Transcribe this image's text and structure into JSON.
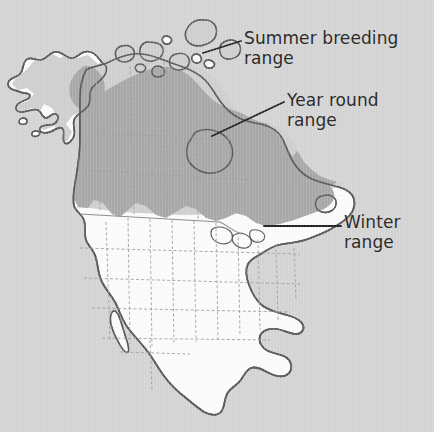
{
  "figure": {
    "kind": "bird-range-map",
    "background_color": "#d4d4d4",
    "outline_color": "#555555",
    "region_border_color": "#9a9a9a",
    "leader_line_color": "#1f1f1f",
    "text_color": "#2b2b2b"
  },
  "legend_labels": [
    {
      "id": "summer",
      "text": "Summer breeding\nrange",
      "name": "summer-breeding-range-label",
      "fill_color": "#cccccc",
      "leader": {
        "x1": 203,
        "y1": 53,
        "x2": 241,
        "y2": 41
      }
    },
    {
      "id": "yearround",
      "text": "Year round\nrange",
      "name": "year-round-range-label",
      "fill_color": "#a9a9a9",
      "leader": {
        "x1": 212,
        "y1": 136,
        "x2": 284,
        "y2": 102
      }
    },
    {
      "id": "winter",
      "text": "Winter\nrange",
      "name": "winter-range-label",
      "fill_color": "#fbfbfb",
      "leader": {
        "x1": 264,
        "y1": 226,
        "x2": 341,
        "y2": 226
      }
    }
  ],
  "map": {
    "continent": "North America",
    "land_fill": "#fbfbfb",
    "areas": [
      {
        "id": "summer-breeding-area",
        "label": "Summer breeding range",
        "color": "#cccccc"
      },
      {
        "id": "year-round-area",
        "label": "Year round range",
        "color": "#a9a9a9"
      },
      {
        "id": "winter-area",
        "label": "Winter range",
        "color": "#fbfbfb"
      }
    ]
  }
}
